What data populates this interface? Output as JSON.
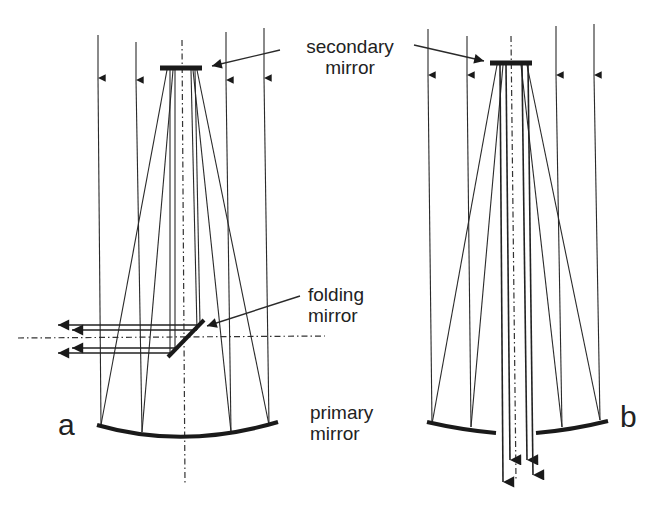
{
  "figure": {
    "panels": [
      {
        "id": "a",
        "letter": "a",
        "incoming_ray_x": [
          98,
          136,
          227,
          265
        ],
        "secondary_mirror": {
          "x1": 160,
          "x2": 202,
          "y": 68
        },
        "optical_axis_x": 182,
        "primary_mirror": {
          "left": [
            97,
            425
          ],
          "bottom": [
            182,
            437
          ],
          "right": [
            278,
            423
          ]
        },
        "folding_mirror": {
          "from": [
            168,
            357
          ],
          "to": [
            204,
            320
          ]
        },
        "horizontal_axis_y": 338,
        "output_rays_y": [
          325,
          330,
          348,
          353
        ],
        "output_direction": "left"
      },
      {
        "id": "b",
        "letter": "b",
        "incoming_ray_x": [
          428,
          467,
          556,
          595
        ],
        "secondary_mirror": {
          "x1": 490,
          "x2": 532,
          "y": 63
        },
        "optical_axis_x": 511,
        "primary_mirror_segments": [
          {
            "from": [
              427,
              423
            ],
            "to": [
              496,
              433
            ]
          },
          {
            "from": [
              536,
              433
            ],
            "to": [
              608,
              423
            ]
          }
        ],
        "output_rays_x": [
          502,
          508,
          526,
          532
        ],
        "output_direction": "down"
      }
    ]
  },
  "labels": {
    "secondary": {
      "line1": "secondary",
      "line2": "mirror"
    },
    "folding": {
      "line1": "folding",
      "line2": "mirror"
    },
    "primary": {
      "line1": "primary",
      "line2": "mirror"
    },
    "panel_a": "a",
    "panel_b": "b"
  },
  "colors": {
    "background": "#ffffff",
    "ink": "#222222"
  }
}
